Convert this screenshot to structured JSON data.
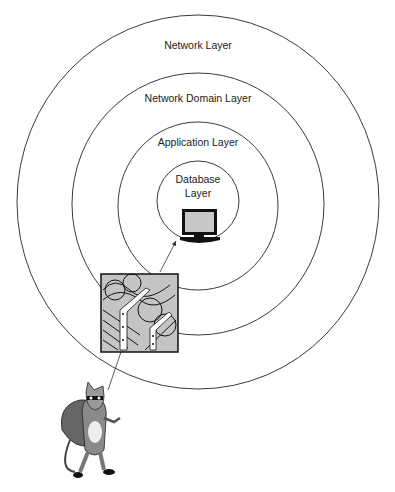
{
  "diagram": {
    "type": "concentric-layers",
    "layers": [
      {
        "name": "Network Layer"
      },
      {
        "name": "Network Domain Layer"
      },
      {
        "name": "Application Layer"
      },
      {
        "name": "Database Layer",
        "lines": [
          "Database",
          "Layer"
        ]
      }
    ],
    "icons": {
      "core": "computer-monitor-icon",
      "barrier": "barbed-wire-fence-icon",
      "attacker": "burglar-rat-cartoon-icon"
    },
    "arrows": [
      {
        "from": "attacker",
        "to": "barrier"
      },
      {
        "from": "barrier",
        "to": "core"
      }
    ]
  }
}
